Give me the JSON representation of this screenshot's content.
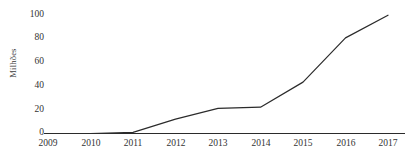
{
  "chart_data": {
    "type": "line",
    "title": "",
    "subtitle": "",
    "xlabel": "",
    "ylabel": "Milhões",
    "categories": [
      "2009",
      "2010",
      "2011",
      "2012",
      "2013",
      "2014",
      "2015",
      "2016",
      "2017"
    ],
    "x": [
      2009,
      2010,
      2011,
      2012,
      2013,
      2014,
      2015,
      2016,
      2017
    ],
    "values": [
      0,
      0,
      1,
      12,
      21,
      22,
      43,
      80,
      99
    ],
    "series": [
      {
        "name": "",
        "values": [
          0,
          0,
          1,
          12,
          21,
          22,
          43,
          80,
          99
        ]
      }
    ],
    "ylim": [
      0,
      100
    ],
    "yticks": [
      0,
      20,
      40,
      60,
      80,
      100
    ],
    "ytick_labels": [
      "0",
      "20",
      "40",
      "60",
      "80",
      "100"
    ],
    "xtick_labels": [
      "2009",
      "2010",
      "2011",
      "2012",
      "2013",
      "2014",
      "2015",
      "2016",
      "2017"
    ],
    "grid": false,
    "legend": false,
    "legend_position": "none",
    "line_color": "#2b2b2b",
    "axis_color": "#2b2b2b",
    "background_color": "#ffffff",
    "marker": "none",
    "annotations": []
  },
  "axes": {
    "y_axis_title": "Milhões",
    "y_tick_values": [
      "100",
      "80",
      "60",
      "40",
      "20",
      "0"
    ],
    "x_tick_values": [
      "2009",
      "2010",
      "2011",
      "2012",
      "2013",
      "2014",
      "2015",
      "2016",
      "2017"
    ]
  },
  "colors": {
    "line": "#2b2b2b",
    "axis": "#2b2b2b",
    "text": "#333333",
    "background": "#ffffff"
  }
}
